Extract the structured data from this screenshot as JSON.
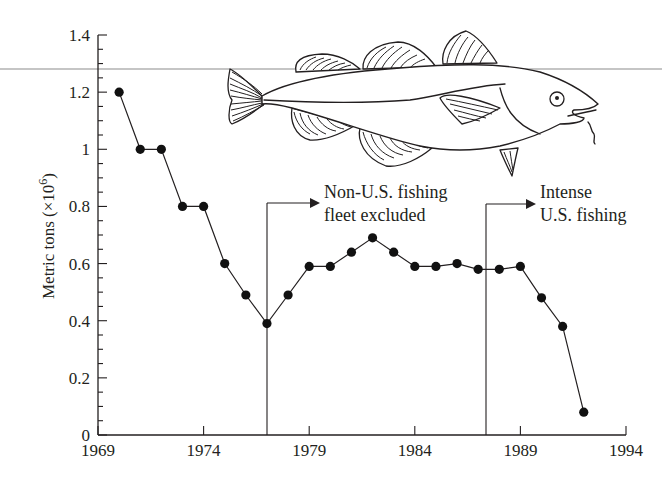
{
  "chart_data": {
    "type": "line",
    "title": "",
    "xlabel": "",
    "ylabel": "Metric tons (×10⁶)",
    "ylabel_main": "Metric tons (×10",
    "ylabel_exp": "6",
    "ylabel_close": ")",
    "xlim": [
      1969,
      1994
    ],
    "ylim": [
      0,
      1.4
    ],
    "x_ticks": [
      "1969",
      "1974",
      "1979",
      "1984",
      "1989",
      "1994"
    ],
    "y_ticks": [
      "0",
      "0.2",
      "0.4",
      "0.6",
      "0.8",
      "1",
      "1.2",
      "1.4"
    ],
    "grid": false,
    "legend": null,
    "series": [
      {
        "name": "Cod catch",
        "marker": "filled-circle",
        "x": [
          1970,
          1971,
          1972,
          1973,
          1974,
          1975,
          1976,
          1977,
          1978,
          1979,
          1980,
          1981,
          1982,
          1983,
          1984,
          1985,
          1986,
          1987,
          1988,
          1989,
          1990,
          1991,
          1992
        ],
        "values": [
          1.2,
          1.0,
          1.0,
          0.8,
          0.8,
          0.6,
          0.49,
          0.39,
          0.49,
          0.59,
          0.59,
          0.64,
          0.69,
          0.64,
          0.59,
          0.59,
          0.6,
          0.58,
          0.58,
          0.59,
          0.48,
          0.38,
          0.08
        ]
      }
    ],
    "annotations": [
      {
        "x": 1977.3,
        "lines": [
          "Non-U.S. fishing",
          "fleet excluded"
        ],
        "type": "vertical-line-with-arrow"
      },
      {
        "x": 1987.8,
        "lines": [
          "Intense",
          "U.S. fishing"
        ],
        "type": "vertical-line-with-arrow"
      }
    ],
    "reference_line": {
      "y": 1.29,
      "description": "horizontal line across figure"
    },
    "illustration": "cod-fish"
  },
  "colors": {
    "ink": "#231f20",
    "background": "#ffffff",
    "reference_line": "#8c8c8c"
  }
}
